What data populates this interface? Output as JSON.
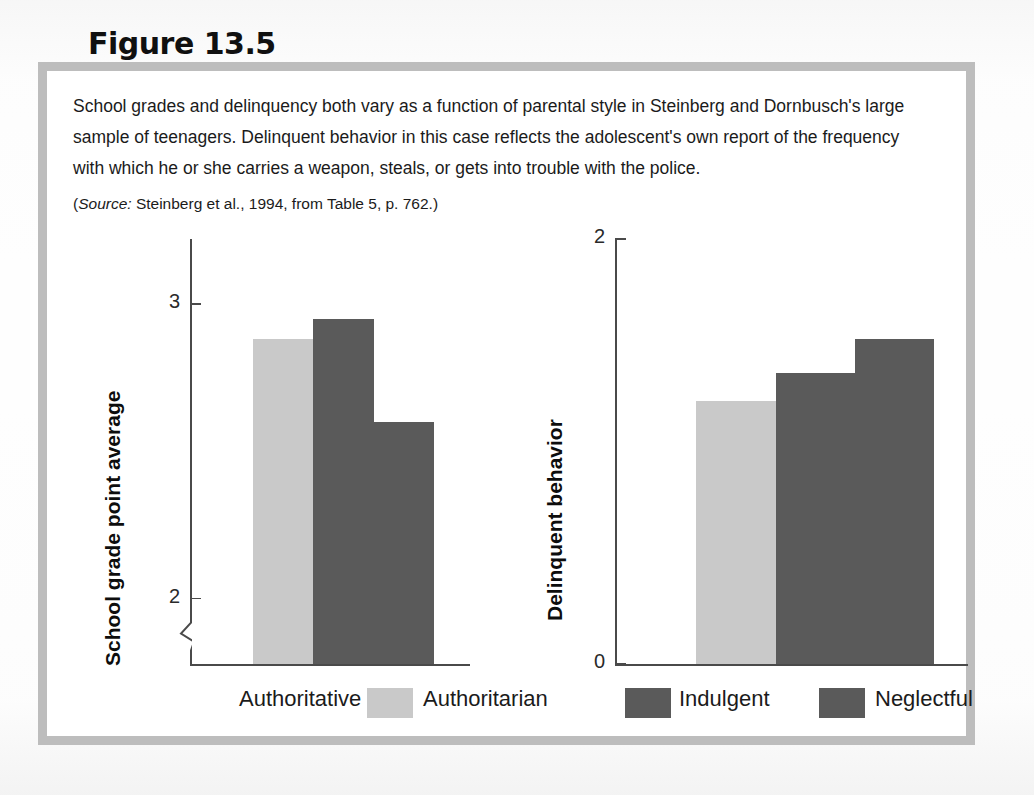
{
  "figure": {
    "number_label": "Figure 13.5",
    "caption": "School grades and delinquency both vary as a function of parental style in Steinberg and Dornbusch's large sample of teenagers. Delinquent behavior in this case reflects the adolescent's own report of the frequency with which he or she carries a weapon, steals, or gets into trouble with the police.",
    "source_prefix": "Source:",
    "source_text": " Steinberg et al., 1994, from Table 5, p. 762.",
    "source_open_paren": "(",
    "source_close_paren": ")"
  },
  "legend": {
    "position": "bottom",
    "items": [
      {
        "label": "Authoritative",
        "swatch": "#ffffff",
        "swatch_visible": false
      },
      {
        "label": "Authoritarian",
        "swatch": "#c9c9c9",
        "swatch_visible": true
      },
      {
        "label": "Indulgent",
        "swatch": "#5a5a5a",
        "swatch_visible": true
      },
      {
        "label": "Neglectful",
        "swatch": "#5a5a5a",
        "swatch_visible": true
      }
    ]
  },
  "colors": {
    "frame": "#bdbdbd",
    "panel": "#ffffff",
    "axis": "#4a4a4a",
    "bar_white": "#ffffff",
    "bar_light": "#c9c9c9",
    "bar_dark": "#5a5a5a",
    "text": "#1b1b1b"
  },
  "chart_data": [
    {
      "type": "bar",
      "id": "school-grades",
      "title": "",
      "xlabel": "",
      "ylabel": "School grade point average",
      "categories": [
        "Authoritative",
        "Authoritarian",
        "Indulgent",
        "Neglectful"
      ],
      "values": [
        2.0,
        2.88,
        2.95,
        2.6
      ],
      "bar_colors": [
        "#ffffff",
        "#c9c9c9",
        "#5a5a5a",
        "#5a5a5a"
      ],
      "ylim": [
        1.78,
        3.22
      ],
      "yticks": [
        2,
        3
      ],
      "ytick_labels": [
        "2",
        "3"
      ],
      "axis_break": true,
      "grid": false,
      "legend": "bottom"
    },
    {
      "type": "bar",
      "id": "delinquent-behavior",
      "title": "",
      "xlabel": "",
      "ylabel": "Delinquent behavior",
      "categories": [
        "Authoritative",
        "Authoritarian",
        "Indulgent",
        "Neglectful"
      ],
      "values": [
        0.0,
        1.24,
        1.37,
        1.53
      ],
      "bar_colors": [
        "#ffffff",
        "#c9c9c9",
        "#5a5a5a",
        "#5a5a5a"
      ],
      "ylim": [
        0,
        2
      ],
      "yticks": [
        0,
        2
      ],
      "ytick_labels": [
        "0",
        "2"
      ],
      "axis_break": false,
      "grid": false,
      "legend": "bottom"
    }
  ]
}
